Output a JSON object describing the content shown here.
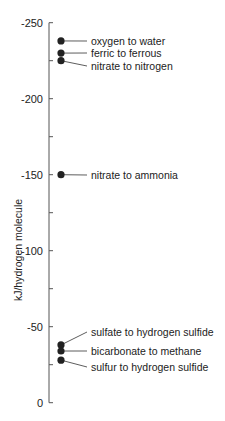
{
  "chart_data": {
    "type": "scatter",
    "title": "",
    "xlabel": "",
    "ylabel": "kJ/hydrogen molecule",
    "ylim": [
      0,
      -250
    ],
    "yticks": [
      -250,
      -200,
      -150,
      -100,
      -50,
      0
    ],
    "ytick_labels": [
      "-250",
      "-200",
      "-150",
      "-100",
      "-50",
      "0"
    ],
    "grid": false,
    "legend": "none",
    "points": [
      {
        "label": "oxygen to water",
        "y": -238
      },
      {
        "label": "ferric to ferrous",
        "y": -230
      },
      {
        "label": "nitrate to nitrogen",
        "y": -225
      },
      {
        "label": "nitrate to ammonia",
        "y": -150
      },
      {
        "label": "sulfate to hydrogen sulfide",
        "y": -38
      },
      {
        "label": "bicarbonate to methane",
        "y": -34
      },
      {
        "label": "sulfur to hydrogen sulfide",
        "y": -28
      }
    ]
  }
}
